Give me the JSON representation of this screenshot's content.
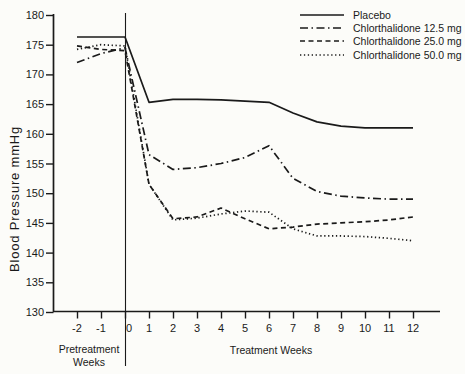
{
  "figure": {
    "y_axis_label": "Blood Pressure mmHg",
    "pretreatment_label": "Pretreatment\nWeeks",
    "treatment_label": "Treatment Weeks"
  },
  "chart_data": {
    "type": "line",
    "title": "",
    "xlabel_pretreatment": "Pretreatment Weeks",
    "xlabel_treatment": "Treatment Weeks",
    "ylabel": "Blood Pressure mmHg",
    "x": [
      -2,
      -1,
      0,
      1,
      2,
      3,
      4,
      5,
      6,
      7,
      8,
      9,
      10,
      11,
      12
    ],
    "x_ticks": [
      -2,
      -1,
      0,
      1,
      2,
      3,
      4,
      5,
      6,
      7,
      8,
      9,
      10,
      11,
      12
    ],
    "y_ticks": [
      130,
      135,
      140,
      145,
      150,
      155,
      160,
      165,
      170,
      175,
      180
    ],
    "ylim": [
      130,
      180
    ],
    "xlim": [
      -2,
      12
    ],
    "grid": false,
    "legend_position": "top-right",
    "line_color": "#1a1a1a",
    "background_color": "#fcfcf9",
    "treatment_start_week": 0,
    "series": [
      {
        "name": "Placebo",
        "style": "solid",
        "values": [
          176.3,
          176.3,
          176.3,
          165.3,
          165.8,
          165.8,
          165.7,
          165.5,
          165.3,
          163.5,
          162.0,
          161.3,
          161.0,
          161.0,
          161.0
        ]
      },
      {
        "name": "Chlorthalidone 12.5 mg",
        "style": "dashdot",
        "values": [
          172.0,
          173.5,
          174.5,
          156.5,
          154.0,
          154.3,
          155.0,
          156.0,
          158.0,
          152.5,
          150.3,
          149.5,
          149.2,
          149.0,
          149.0
        ]
      },
      {
        "name": "Chlorthalidone 25.0 mg",
        "style": "dashed",
        "values": [
          174.8,
          174.2,
          174.0,
          151.5,
          145.7,
          146.0,
          147.5,
          145.7,
          144.0,
          144.3,
          144.8,
          145.0,
          145.2,
          145.5,
          146.0
        ]
      },
      {
        "name": "Chlorthalidone 50.0 mg",
        "style": "dotted",
        "values": [
          174.2,
          175.0,
          174.8,
          151.5,
          145.5,
          145.8,
          146.5,
          147.0,
          146.8,
          144.0,
          142.8,
          142.8,
          142.7,
          142.4,
          142.0
        ]
      }
    ]
  }
}
